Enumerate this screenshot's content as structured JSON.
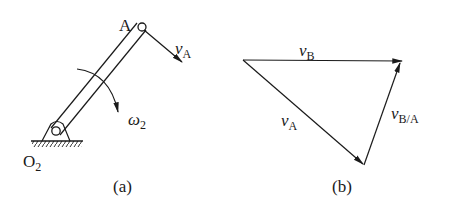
{
  "figure_a": {
    "caption": "(a)",
    "point_a_label": "A",
    "pivot_label": "O",
    "pivot_sub": "2",
    "velocity_label": "v",
    "velocity_sub": "A",
    "omega_label": "ω",
    "omega_sub": "2"
  },
  "figure_b": {
    "caption": "(b)",
    "vb_label": "v",
    "vb_sub": "B",
    "va_label": "v",
    "va_sub": "A",
    "vba_label": "v",
    "vba_sub": "B/A"
  },
  "colors": {
    "stroke": "#1a1a1a",
    "background": "#ffffff"
  }
}
